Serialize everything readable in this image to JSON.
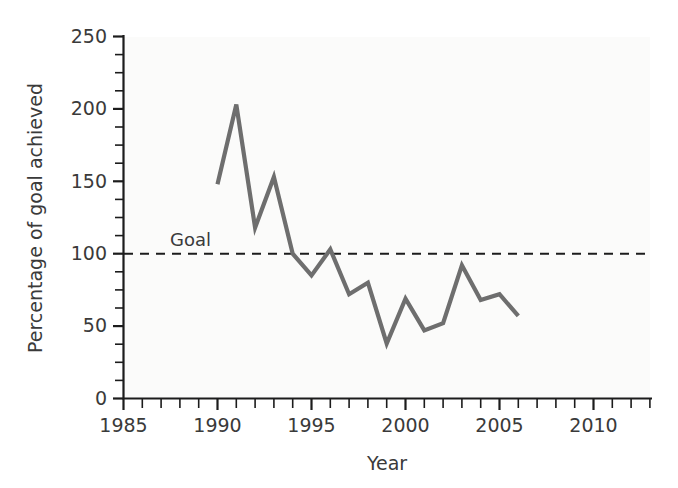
{
  "chart_data": {
    "type": "line",
    "title": "",
    "xlabel": "Year",
    "ylabel": "Percentage of goal achieved",
    "xlim": [
      1985,
      2010
    ],
    "ylim": [
      0,
      250
    ],
    "grid": false,
    "legend": "none",
    "x_major_ticks": [
      1985,
      1990,
      1995,
      2000,
      2005,
      2010
    ],
    "x_tick_labels": [
      "1985",
      "1990",
      "1995",
      "2000",
      "2005",
      "2010"
    ],
    "x_minor_step": 1,
    "y_major_ticks": [
      0,
      50,
      100,
      150,
      200,
      250
    ],
    "y_tick_labels": [
      "0",
      "50",
      "100",
      "150",
      "200",
      "250"
    ],
    "y_minor_step": 12.5,
    "line_color": "#6e6e6e",
    "line_width": 4.2,
    "x": [
      1990,
      1991,
      1992,
      1993,
      1994,
      1995,
      1996,
      1997,
      1998,
      1999,
      2000,
      2001,
      2002,
      2003,
      2004,
      2005,
      2006
    ],
    "values": [
      148,
      203,
      118,
      153,
      100,
      85,
      103,
      72,
      80,
      38,
      69,
      47,
      52,
      92,
      68,
      72,
      57
    ],
    "series": [
      {
        "name": "Percentage of goal achieved",
        "values": [
          148,
          203,
          118,
          153,
          100,
          85,
          103,
          72,
          80,
          38,
          69,
          47,
          52,
          92,
          68,
          72,
          57
        ]
      }
    ],
    "annotations": [
      {
        "name": "goal-reference-line",
        "label": "Goal",
        "y_value": 100,
        "style": "dashed",
        "color": "#1c1c1c"
      }
    ]
  }
}
